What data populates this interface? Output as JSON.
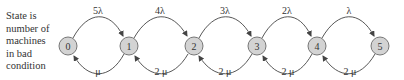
{
  "caption": {
    "lines": [
      "State is",
      "number of",
      "machines",
      "in bad",
      "condition"
    ]
  },
  "nodes": [
    {
      "id": "0",
      "label": "0"
    },
    {
      "id": "1",
      "label": "1"
    },
    {
      "id": "2",
      "label": "2"
    },
    {
      "id": "3",
      "label": "3"
    },
    {
      "id": "4",
      "label": "4"
    },
    {
      "id": "5",
      "label": "5"
    }
  ],
  "forward_transitions": [
    {
      "from": "0",
      "to": "1",
      "rate": "5λ"
    },
    {
      "from": "1",
      "to": "2",
      "rate": "4λ"
    },
    {
      "from": "2",
      "to": "3",
      "rate": "3λ"
    },
    {
      "from": "3",
      "to": "4",
      "rate": "2λ"
    },
    {
      "from": "4",
      "to": "5",
      "rate": "λ"
    }
  ],
  "backward_transitions": [
    {
      "from": "1",
      "to": "0",
      "rate": "μ"
    },
    {
      "from": "2",
      "to": "1",
      "rate": "2 μ"
    },
    {
      "from": "3",
      "to": "2",
      "rate": "2 μ"
    },
    {
      "from": "4",
      "to": "3",
      "rate": "2 μ"
    },
    {
      "from": "5",
      "to": "4",
      "rate": "2 μ"
    }
  ],
  "colors": {
    "node_fill": "#d3d3d3",
    "node_stroke": "#777777",
    "arrow": "#444444"
  }
}
